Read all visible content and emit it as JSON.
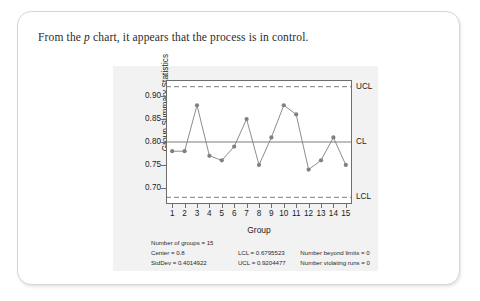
{
  "caption": {
    "before": "From the ",
    "italic": "p",
    "after": " chart, it appears that the process is in control."
  },
  "chart_data": {
    "type": "line",
    "title": "",
    "xlabel": "Group",
    "ylabel": "Group Summary Statistics",
    "x": [
      1,
      2,
      3,
      4,
      5,
      6,
      7,
      8,
      9,
      10,
      11,
      12,
      13,
      14,
      15
    ],
    "categories": [
      "1",
      "2",
      "3",
      "4",
      "5",
      "6",
      "7",
      "8",
      "9",
      "10",
      "11",
      "12",
      "13",
      "14",
      "15"
    ],
    "values": [
      0.78,
      0.78,
      0.88,
      0.77,
      0.76,
      0.79,
      0.85,
      0.75,
      0.81,
      0.88,
      0.86,
      0.74,
      0.76,
      0.81,
      0.75
    ],
    "ylim": [
      0.665,
      0.935
    ],
    "yticks": [
      0.7,
      0.75,
      0.8,
      0.85,
      0.9
    ],
    "ytick_labels": [
      "0.70",
      "0.75",
      "0.80",
      "0.85",
      "0.90"
    ],
    "grid": false,
    "legend_position": "right-axis-labels",
    "reference_lines": [
      {
        "name": "UCL",
        "label": "UCL",
        "value": 0.9204477,
        "style": "dashed"
      },
      {
        "name": "CL",
        "label": "CL",
        "value": 0.8,
        "style": "solid"
      },
      {
        "name": "LCL",
        "label": "LCL",
        "value": 0.6795523,
        "style": "dashed"
      }
    ],
    "marker": "filled-circle",
    "series_color": "#808080"
  },
  "stats": {
    "rows": [
      {
        "col1": "Number of groups = 15",
        "col2": "",
        "col3": ""
      },
      {
        "col1": "Center = 0.8",
        "col2": "LCL = 0.6795523",
        "col3": "Number beyond limits = 0"
      },
      {
        "col1": "StdDev = 0.4014922",
        "col2": "UCL = 0.9204477",
        "col3": "Number violating runs = 0"
      }
    ]
  }
}
